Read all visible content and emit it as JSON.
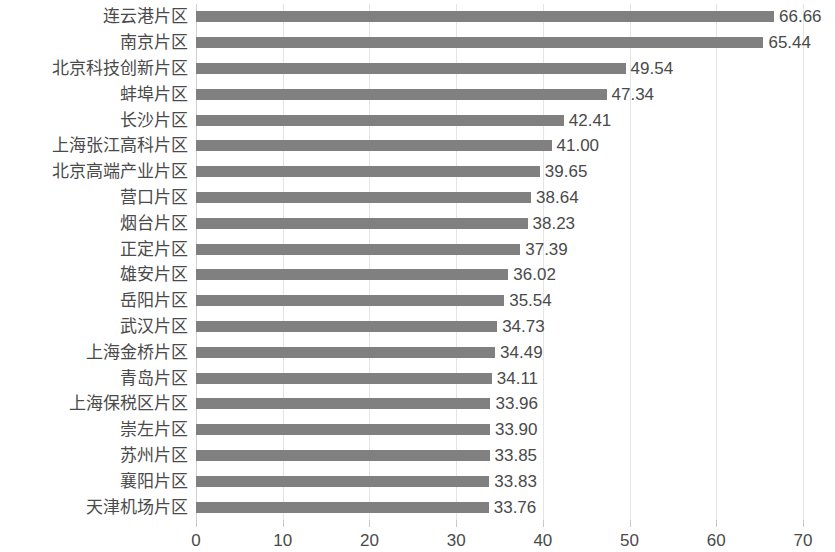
{
  "chart_data": {
    "type": "bar",
    "orientation": "horizontal",
    "title": "",
    "subtitle": "",
    "xlabel": "",
    "ylabel": "",
    "xlim": [
      0,
      70
    ],
    "xticks": [
      0,
      10,
      20,
      30,
      40,
      50,
      60,
      70
    ],
    "tick_labels": [
      "0",
      "10",
      "20",
      "30",
      "40",
      "50",
      "60",
      "70"
    ],
    "grid": true,
    "grid_axis": "x",
    "legend": false,
    "legend_position": "none",
    "bar_color": "#808080",
    "gridline_color": "#e4e4e4",
    "text_color": "#4a4a4a",
    "background_color": "#ffffff",
    "value_label_format": "0.00",
    "categories": [
      "连云港片区",
      "南京片区",
      "北京科技创新片区",
      "蚌埠片区",
      "长沙片区",
      "上海张江高科片区",
      "北京高端产业片区",
      "营口片区",
      "烟台片区",
      "正定片区",
      "雄安片区",
      "岳阳片区",
      "武汉片区",
      "上海金桥片区",
      "青岛片区",
      "上海保税区片区",
      "崇左片区",
      "苏州片区",
      "襄阳片区",
      "天津机场片区"
    ],
    "values": [
      66.66,
      65.44,
      49.54,
      47.34,
      42.41,
      41.0,
      39.65,
      38.64,
      38.23,
      37.39,
      36.02,
      35.54,
      34.73,
      34.49,
      34.11,
      33.96,
      33.9,
      33.85,
      33.83,
      33.76
    ],
    "value_labels": [
      "66.66",
      "65.44",
      "49.54",
      "47.34",
      "42.41",
      "41.00",
      "39.65",
      "38.64",
      "38.23",
      "37.39",
      "36.02",
      "35.54",
      "34.73",
      "34.49",
      "34.11",
      "33.96",
      "33.90",
      "33.85",
      "33.83",
      "33.76"
    ]
  }
}
